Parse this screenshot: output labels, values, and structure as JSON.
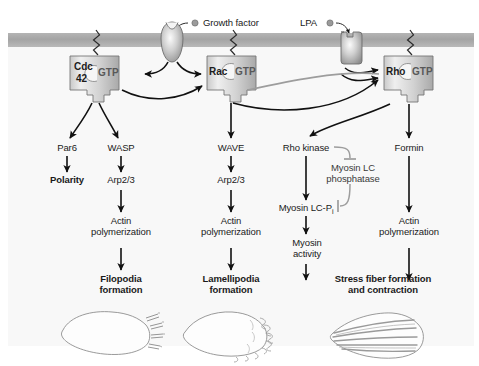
{
  "figure": {
    "type": "diagram",
    "membrane_color": "#a9a9a9",
    "cytoplasm_color": "#f7f7f7",
    "arrow_color": "#111111",
    "inhibit_color": "#9a9a9a"
  },
  "ligands": [
    {
      "name": "growth-factor",
      "label": "Growth factor"
    },
    {
      "name": "lpa",
      "label": "LPA"
    }
  ],
  "gtpases": [
    {
      "name": "cdc42",
      "line1": "Cdc",
      "line2": "42",
      "nucleotide": "GTP"
    },
    {
      "name": "rac",
      "line1": "Rac",
      "line2": "",
      "nucleotide": "GTP"
    },
    {
      "name": "rho",
      "line1": "Rho",
      "line2": "",
      "nucleotide": "GTP"
    }
  ],
  "effectors": {
    "par6": "Par6",
    "wasp": "WASP",
    "wave": "WAVE",
    "rho_kinase": "Rho kinase",
    "formin": "Formin",
    "myosin_lc_phosphatase_line1": "Myosin LC",
    "myosin_lc_phosphatase_line2": "phosphatase"
  },
  "intermediates": {
    "polarity": "Polarity",
    "arp23_cdc42": "Arp2/3",
    "arp23_rac": "Arp2/3",
    "myosin_lc_pi_pre": "Myosin LC-P",
    "myosin_lc_pi_sub": "i",
    "actin_poly_1_line1": "Actin",
    "actin_poly_1_line2": "polymerization",
    "actin_poly_2_line1": "Actin",
    "actin_poly_2_line2": "polymerization",
    "actin_poly_3_line1": "Actin",
    "actin_poly_3_line2": "polymerization",
    "myosin_activity_line1": "Myosin",
    "myosin_activity_line2": "activity"
  },
  "outcomes": [
    {
      "name": "filopodia",
      "line1": "Filopodia",
      "line2": "formation"
    },
    {
      "name": "lamellipodia",
      "line1": "Lamellipodia",
      "line2": "formation"
    },
    {
      "name": "stress-fiber",
      "line1": "Stress fiber formation",
      "line2": "and contraction"
    }
  ],
  "cells": [
    {
      "name": "filopodia-cell",
      "morphology": "spiky protrusions"
    },
    {
      "name": "lamellipodia-cell",
      "morphology": "ruffled leading edge"
    },
    {
      "name": "stress-fiber-cell",
      "morphology": "internal parallel fibers"
    }
  ]
}
